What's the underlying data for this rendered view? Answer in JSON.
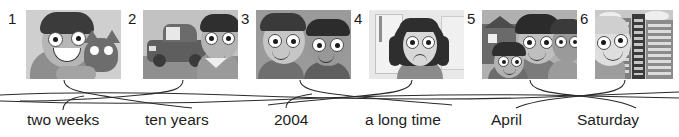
{
  "exercise": {
    "type": "matching",
    "title": "",
    "instructions": ""
  },
  "panels": [
    {
      "number": "1",
      "caption": "boy holding a cat",
      "alt": "A smiling boy hugging a cat",
      "bg": "#c9c9c9"
    },
    {
      "number": "2",
      "caption": "boy beside an old car",
      "alt": "A boy standing next to a dark car",
      "bg": "#b9b9b9"
    },
    {
      "number": "3",
      "caption": "two friends smiling",
      "alt": "Two children's faces side by side",
      "bg": "#9d9d9d"
    },
    {
      "number": "4",
      "caption": "girl waiting by a window",
      "alt": "An unhappy girl with long hair waiting",
      "bg": "#e4e4e4"
    },
    {
      "number": "5",
      "caption": "family in front of a house",
      "alt": "A family of three smiling outside a house",
      "bg": "#a8a8a8"
    },
    {
      "number": "6",
      "caption": "boy in the city",
      "alt": "A boy in front of tall city buildings",
      "bg": "#c4c4c4"
    }
  ],
  "labels": [
    {
      "text": "two weeks"
    },
    {
      "text": "ten years"
    },
    {
      "text": "2004"
    },
    {
      "text": "a long time"
    },
    {
      "text": "April"
    },
    {
      "text": "Saturday"
    }
  ],
  "connections": [
    {
      "from_panel": "1",
      "to_label": "ten years"
    },
    {
      "from_panel": "2",
      "to_label": "two weeks"
    },
    {
      "from_panel": "3",
      "to_label": "a long time"
    },
    {
      "from_panel": "4",
      "to_label": "2004"
    },
    {
      "from_panel": "5",
      "to_label": "Saturday"
    },
    {
      "from_panel": "6",
      "to_label": "April"
    }
  ],
  "colors": {
    "ink": "#2b2b2b",
    "text": "#1d1d1d",
    "paper": "#ffffff"
  }
}
